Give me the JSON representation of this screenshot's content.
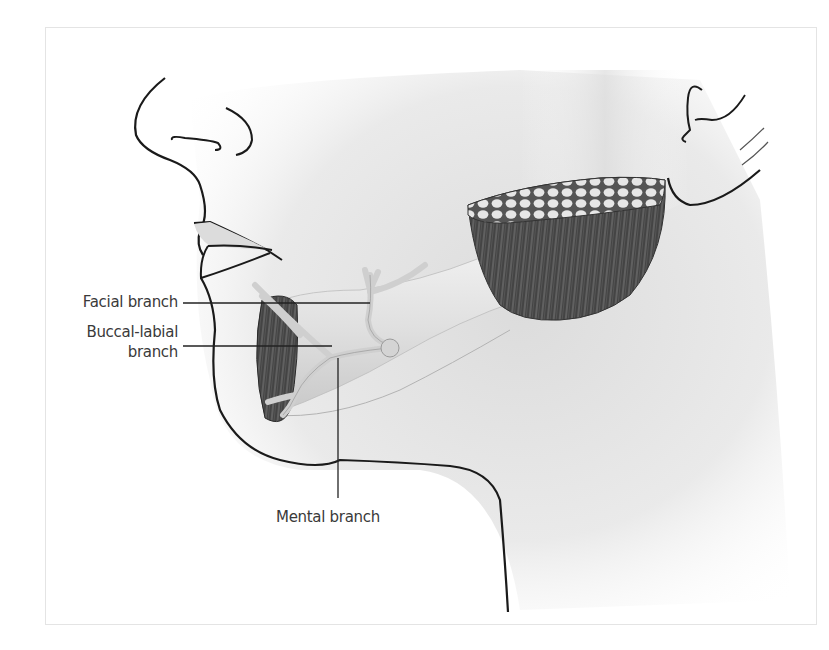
{
  "figure": {
    "labels": {
      "facial_branch": "Facial branch",
      "buccal_labial_line1": "Buccal-labial",
      "buccal_labial_line2": "branch",
      "mental_branch": "Mental branch"
    },
    "colors": {
      "outline": "#1a1a1a",
      "label_text": "#3a3a3a",
      "leader_line": "#222222",
      "skin_shade": "#d8d8d8",
      "muscle_dark": "#3c3c3c",
      "nerve": "#cfcfcf",
      "frame_border": "#e4e4e4"
    }
  }
}
